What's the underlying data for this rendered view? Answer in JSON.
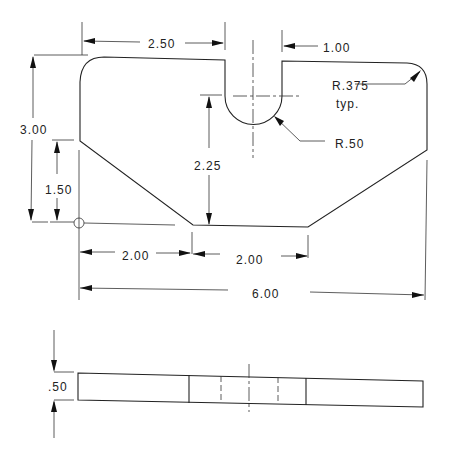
{
  "drawing": {
    "type": "orthographic technical drawing",
    "views": [
      "front view",
      "edge view"
    ],
    "dimensions": {
      "slot_left_offset": "2.50",
      "slot_width": "1.00",
      "corner_radius": "R.375",
      "corner_radius_note": "typ.",
      "slot_radius": "R.50",
      "overall_height": "3.00",
      "chamfer_height": "1.50",
      "slot_depth_to_bottom": "2.25",
      "bottom_left_offset": "2.00",
      "bottom_flat_width": "2.00",
      "overall_width": "6.00",
      "thickness": ".50"
    }
  }
}
